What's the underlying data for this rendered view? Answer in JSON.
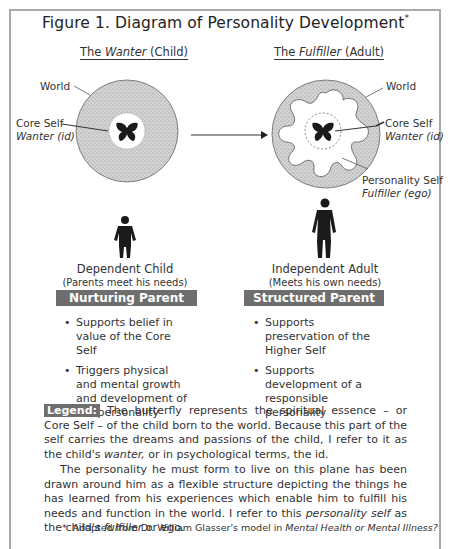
{
  "figure": {
    "title": "Figure 1. Diagram of Personality Development",
    "title_mark": "*"
  },
  "left": {
    "heading_prefix": "The ",
    "heading_italic": "Wanter",
    "heading_suffix": " (Child)",
    "label_world": "World",
    "label_core_self": "Core Self",
    "label_core_self_sub": "Wanter (id)",
    "caption": "Dependent Child",
    "subcaption": "(Parents meet his needs)",
    "bar_label": "Nurturing Parent",
    "bullets": [
      "Supports belief in value of the Core Self",
      "Triggers physical and mental growth and development of the personality"
    ]
  },
  "right": {
    "heading_prefix": "The ",
    "heading_italic": "Fulfiller",
    "heading_suffix": " (Adult)",
    "label_world": "World",
    "label_core_self": "Core Self",
    "label_core_self_sub": "Wanter (id)",
    "label_personality_self": "Personality Self",
    "label_personality_self_sub": "Fulfiller (ego)",
    "caption": "Independent Adult",
    "subcaption": "(Meets his own needs)",
    "bar_label": "Structured Parent",
    "bullets": [
      "Supports preservation of the Higher Self",
      "Supports development of a responsible personality"
    ]
  },
  "legend": {
    "badge": "Legend:",
    "p1_a": " The butterfly represents the spiritual essence – or Core Self – of the child born to the world. Because this part of the self carries the dreams and passions of the child, I refer to it as the child's ",
    "p1_italic": "wanter,",
    "p1_b": " or in psychological terms, the id.",
    "p2_a": "The personality he must form to live on this plane has been drawn around him as a flexible structure depicting the things he has learned from his experiences which enable him to fulfill his needs and function in the world. I refer to this ",
    "p2_italic1": "personality self",
    "p2_b": " as the child's ",
    "p2_italic2": "fulfiller",
    "p2_c": " or ego."
  },
  "footnote": {
    "mark": "*",
    "text": "Adapted from Dr. William Glasser's model in ",
    "italic": "Mental Health or Mental Illness?"
  },
  "colors": {
    "frame": "#a9a9a9",
    "bar": "#6e6e6e",
    "stipple": "#c8c8c8",
    "ink": "#1a1a1a"
  }
}
